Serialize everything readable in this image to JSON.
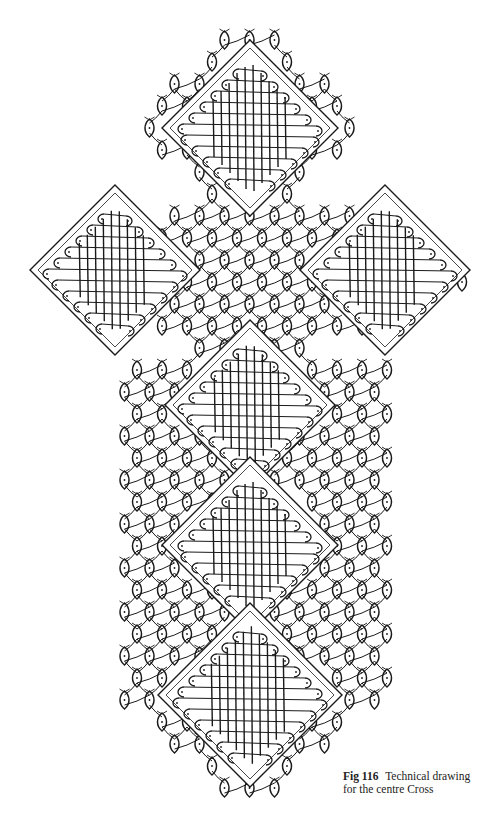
{
  "figure": {
    "number_label": "Fig 116",
    "title": "Technical drawing",
    "title_line2": "for the centre Cross"
  },
  "diagram": {
    "ground": "hexagonal ground with eye/leaf pin stitches",
    "ink_color": "#1a1a1a",
    "background_color": "#ffffff",
    "arms": [
      {
        "name": "top",
        "x_range": [
          125,
          385
        ],
        "y_range": [
          22,
          210
        ]
      },
      {
        "name": "crossbar",
        "x_range": [
          28,
          478
        ],
        "y_range": [
          180,
          380
        ]
      },
      {
        "name": "shaft",
        "x_range": [
          118,
          390
        ],
        "y_range": [
          370,
          810
        ]
      }
    ],
    "cloth_blocks": [
      {
        "name": "top-block",
        "cx": 250,
        "cy": 128,
        "half": 88
      },
      {
        "name": "left-block",
        "cx": 115,
        "cy": 270,
        "half": 85
      },
      {
        "name": "right-block",
        "cx": 385,
        "cy": 270,
        "half": 85
      },
      {
        "name": "centre-block",
        "cx": 250,
        "cy": 405,
        "half": 85
      },
      {
        "name": "lower-block-1",
        "cx": 250,
        "cy": 545,
        "half": 88
      },
      {
        "name": "lower-block-2",
        "cx": 250,
        "cy": 695,
        "half": 92
      }
    ]
  }
}
